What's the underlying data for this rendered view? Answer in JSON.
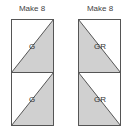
{
  "columns": [
    {
      "title": "Make 8",
      "blocks": [
        {
          "label": "G",
          "shade": "lower-right"
        },
        {
          "label": "G",
          "shade": "lower-right"
        }
      ]
    },
    {
      "title": "Make 8",
      "blocks": [
        {
          "label": "GR",
          "shade": "lower-left"
        },
        {
          "label": "GR",
          "shade": "lower-left"
        }
      ]
    }
  ],
  "colors": {
    "fill": "#d0d0d0",
    "stroke": "#555555",
    "background": "#ffffff"
  }
}
